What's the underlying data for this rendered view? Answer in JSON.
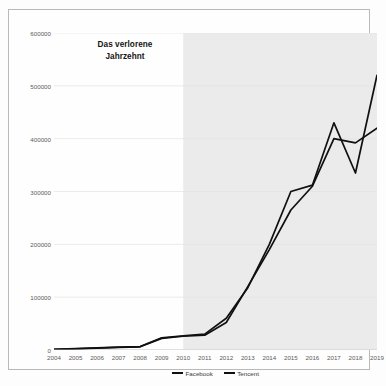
{
  "chart_data": {
    "type": "line",
    "title": "",
    "xlabel": "",
    "ylabel": "",
    "categories": [
      2004,
      2005,
      2006,
      2007,
      2008,
      2009,
      2010,
      2011,
      2012,
      2013,
      2014,
      2015,
      2016,
      2017,
      2018,
      2019
    ],
    "xtick_labels": [
      "2004",
      "2005",
      "2006",
      "2007",
      "2008",
      "2009",
      "2010",
      "2011",
      "2012",
      "2013",
      "2014",
      "2015",
      "2016",
      "2017",
      "2018",
      "2019"
    ],
    "ytick_labels": [
      "0",
      "100000",
      "200000",
      "300000",
      "400000",
      "500000",
      "600000"
    ],
    "ytick_values": [
      0,
      100000,
      200000,
      300000,
      400000,
      500000,
      600000
    ],
    "ylim": [
      0,
      600000
    ],
    "xlim": [
      2004,
      2019
    ],
    "grid": true,
    "grid_axis": "y",
    "legend_position": "bottom",
    "series": [
      {
        "name": "Facebook",
        "color": "#101010",
        "values": [
          1000,
          2000,
          3500,
          5000,
          6000,
          22000,
          26000,
          28000,
          52000,
          120000,
          190000,
          265000,
          310000,
          400000,
          392000,
          420000
        ]
      },
      {
        "name": "Tencent",
        "color": "#101010",
        "values": [
          1200,
          2500,
          4000,
          5500,
          6500,
          23000,
          27000,
          30000,
          60000,
          118000,
          200000,
          300000,
          312000,
          430000,
          335000,
          520000
        ]
      }
    ],
    "annotations": [
      {
        "text": "Das verlorene\nJahrzehnt",
        "line1": "Das verlorene",
        "line2": "Jahrzehnt",
        "region_start": 2004,
        "region_end": 2010
      },
      {
        "text": "Das Jahrzehnt der\nKonsequenzen",
        "line1": "Das Jahrzehnt der",
        "line2": "Konsequenzen",
        "region_start": 2010,
        "region_end": 2019
      }
    ],
    "shaded_region": {
      "start": 2010,
      "end": 2019,
      "color": "#ebebeb"
    }
  },
  "legend": {
    "entries": [
      {
        "label": "Facebook"
      },
      {
        "label": "Tencent"
      }
    ]
  }
}
